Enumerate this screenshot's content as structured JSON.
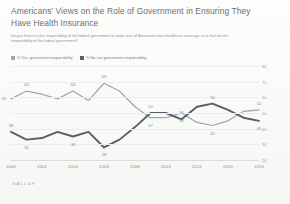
{
  "header": {
    "title": "Americans' Views on the Role of Government in Ensuring They Have Health Insurance",
    "subtitle": "Do you think it is the responsibility of the federal government to make sure all Americans have healthcare coverage, or is that not the responsibility of the federal government?"
  },
  "source": {
    "label": "GALLUP"
  },
  "colors": {
    "yes_series": "#9aa7ae",
    "no_series": "#55606b",
    "grid": "#ececea",
    "text": "#8a8a8a"
  },
  "chart_data": {
    "type": "line",
    "title": "Americans' Views on the Role of Government in Ensuring They Have Health Insurance",
    "xlabel": "",
    "ylabel": "",
    "ylim": [
      20,
      80
    ],
    "yticks": [
      20,
      30,
      40,
      50,
      60,
      70,
      80
    ],
    "grid": true,
    "legend_position": "top-left",
    "x": [
      2000,
      2001,
      2002,
      2003,
      2004,
      2005,
      2006,
      2007,
      2008,
      2009,
      2010,
      2011,
      2012,
      2013,
      2014,
      2015,
      2016
    ],
    "xticks": [
      2000,
      2002,
      2004,
      2006,
      2008,
      2010,
      2012,
      2014,
      2016
    ],
    "series": [
      {
        "name": "% Yes, government responsibility",
        "color": "#9aa7ae",
        "values": [
          59,
          64,
          62,
          59,
          64,
          58,
          69,
          64,
          54,
          47,
          47,
          50,
          44,
          42,
          45,
          51,
          52
        ]
      },
      {
        "name": "% No, not government responsibility",
        "color": "#55606b",
        "values": [
          38,
          33,
          34,
          38,
          35,
          38,
          28,
          33,
          41,
          50,
          50,
          46,
          54,
          56,
          52,
          47,
          45
        ]
      }
    ],
    "point_labels": [
      {
        "series": "% Yes, government responsibility",
        "x": 2000,
        "value": 59,
        "text": "59",
        "pos": "left"
      },
      {
        "series": "% Yes, government responsibility",
        "x": 2001,
        "value": 64,
        "text": "64",
        "pos": "above"
      },
      {
        "series": "% Yes, government responsibility",
        "x": 2004,
        "value": 64,
        "text": "64",
        "pos": "above"
      },
      {
        "series": "% Yes, government responsibility",
        "x": 2006,
        "value": 69,
        "text": "69",
        "pos": "above"
      },
      {
        "series": "% Yes, government responsibility",
        "x": 2009,
        "value": 47,
        "text": "47",
        "pos": "below"
      },
      {
        "series": "% Yes, government responsibility",
        "x": 2011,
        "value": 48,
        "text": "48",
        "pos": "below"
      },
      {
        "series": "% Yes, government responsibility",
        "x": 2013,
        "value": 42,
        "text": "42",
        "pos": "below"
      },
      {
        "series": "% Yes, government responsibility",
        "x": 2016,
        "value": 52,
        "text": "52",
        "pos": "above"
      },
      {
        "series": "% No, not government responsibility",
        "x": 2000,
        "value": 38,
        "text": "38",
        "pos": "above"
      },
      {
        "series": "% No, not government responsibility",
        "x": 2001,
        "value": 31,
        "text": "31",
        "pos": "below"
      },
      {
        "series": "% No, not government responsibility",
        "x": 2004,
        "value": 34,
        "text": "34",
        "pos": "below"
      },
      {
        "series": "% No, not government responsibility",
        "x": 2006,
        "value": 28,
        "text": "28",
        "pos": "below"
      },
      {
        "series": "% No, not government responsibility",
        "x": 2009,
        "value": 50,
        "text": "50",
        "pos": "above"
      },
      {
        "series": "% No, not government responsibility",
        "x": 2011,
        "value": 50,
        "text": "50",
        "pos": "above"
      },
      {
        "series": "% No, not government responsibility",
        "x": 2013,
        "value": 56,
        "text": "56",
        "pos": "above"
      },
      {
        "series": "% No, not government responsibility",
        "x": 2016,
        "value": 45,
        "text": "45",
        "pos": "below"
      }
    ]
  }
}
